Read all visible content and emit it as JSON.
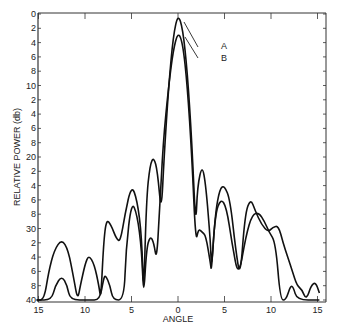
{
  "chart_data": {
    "type": "line",
    "title": "",
    "xlabel": "ANGLE",
    "ylabel": "RELATIVE POWER (db)",
    "xlim": [
      -15,
      15
    ],
    "ylim": [
      0,
      40
    ],
    "y_inverted": true,
    "grid": false,
    "x_ticks": [
      -15,
      -10,
      -5,
      0,
      5,
      10,
      15
    ],
    "x_tick_labels": [
      "15",
      "10",
      "5",
      "0",
      "5",
      "10",
      "15"
    ],
    "y_ticks": [
      0,
      2,
      4,
      6,
      8,
      10,
      12,
      14,
      16,
      18,
      20,
      22,
      24,
      26,
      28,
      30,
      32,
      34,
      36,
      38,
      40
    ],
    "y_tick_labels": [
      "0",
      "2",
      "4",
      "6",
      "8",
      "10",
      "2",
      "4",
      "6",
      "8",
      "20",
      "2",
      "4",
      "6",
      "8",
      "30",
      "2",
      "4",
      "6",
      "8",
      "40"
    ],
    "annotations": [
      {
        "text": "A",
        "points_to": "curve A peak"
      },
      {
        "text": "B",
        "points_to": "curve B peak"
      }
    ],
    "series": [
      {
        "name": "A",
        "points": [
          [
            -15.2,
            40
          ],
          [
            -14.4,
            40
          ],
          [
            -13.9,
            36
          ],
          [
            -13.3,
            33
          ],
          [
            -12.5,
            31.5
          ],
          [
            -11.8,
            33
          ],
          [
            -11.2,
            37
          ],
          [
            -10.8,
            40
          ],
          [
            -10.5,
            38
          ],
          [
            -10.0,
            35
          ],
          [
            -9.6,
            33.7
          ],
          [
            -9.0,
            35
          ],
          [
            -8.5,
            38
          ],
          [
            -8.3,
            40
          ],
          [
            -8.0,
            32
          ],
          [
            -7.7,
            28.7
          ],
          [
            -7.2,
            29.5
          ],
          [
            -6.6,
            31.5
          ],
          [
            -6.2,
            31.8
          ],
          [
            -5.7,
            28
          ],
          [
            -5.0,
            23.9
          ],
          [
            -4.4,
            26
          ],
          [
            -3.9,
            31
          ],
          [
            -3.7,
            40
          ],
          [
            -3.4,
            26
          ],
          [
            -3.0,
            21
          ],
          [
            -2.6,
            20.0
          ],
          [
            -2.2,
            22
          ],
          [
            -1.8,
            28
          ],
          [
            -1.5,
            20
          ],
          [
            -1.0,
            10
          ],
          [
            -0.5,
            3
          ],
          [
            0,
            0
          ],
          [
            0.5,
            2
          ],
          [
            1.0,
            8
          ],
          [
            1.5,
            18
          ],
          [
            1.9,
            30
          ],
          [
            2.1,
            24
          ],
          [
            2.6,
            21.1
          ],
          [
            3.0,
            24
          ],
          [
            3.5,
            32
          ],
          [
            3.6,
            36
          ],
          [
            4.0,
            28
          ],
          [
            4.5,
            24.4
          ],
          [
            5.0,
            24
          ],
          [
            5.6,
            26
          ],
          [
            6.2,
            33
          ],
          [
            6.7,
            37
          ],
          [
            7.2,
            28
          ],
          [
            7.8,
            25.8
          ],
          [
            8.3,
            27.5
          ],
          [
            9.0,
            29.5
          ],
          [
            9.7,
            30.5
          ],
          [
            10.2,
            29.8
          ],
          [
            10.8,
            29.6
          ],
          [
            11.3,
            32
          ],
          [
            11.8,
            34
          ],
          [
            12.3,
            36
          ],
          [
            12.8,
            38
          ],
          [
            13.3,
            38.5
          ],
          [
            13.8,
            40
          ],
          [
            14.3,
            38
          ],
          [
            14.8,
            37.5
          ],
          [
            15.2,
            39
          ]
        ]
      },
      {
        "name": "B",
        "points": [
          [
            -15.2,
            40
          ],
          [
            -13.6,
            40
          ],
          [
            -13.2,
            38
          ],
          [
            -12.5,
            36.6
          ],
          [
            -11.9,
            38
          ],
          [
            -11.6,
            40
          ],
          [
            -9.6,
            40
          ],
          [
            -8.4,
            40
          ],
          [
            -8.0,
            37
          ],
          [
            -7.8,
            36.5
          ],
          [
            -7.3,
            38
          ],
          [
            -7.0,
            40
          ],
          [
            -5.8,
            40
          ],
          [
            -5.6,
            33
          ],
          [
            -5.0,
            26.2
          ],
          [
            -4.4,
            28
          ],
          [
            -3.9,
            33
          ],
          [
            -3.7,
            40
          ],
          [
            -3.4,
            33
          ],
          [
            -3.0,
            31
          ],
          [
            -2.6,
            32
          ],
          [
            -2.3,
            34.5
          ],
          [
            -2.0,
            28
          ],
          [
            -1.6,
            18
          ],
          [
            -1.0,
            10
          ],
          [
            -0.5,
            5
          ],
          [
            0,
            2.5
          ],
          [
            0.5,
            4
          ],
          [
            1.0,
            10
          ],
          [
            1.5,
            20
          ],
          [
            1.9,
            32
          ],
          [
            2.2,
            30
          ],
          [
            2.6,
            30.5
          ],
          [
            3.0,
            31
          ],
          [
            3.5,
            35
          ],
          [
            3.6,
            36
          ],
          [
            4.0,
            28
          ],
          [
            4.6,
            25.8
          ],
          [
            5.2,
            27
          ],
          [
            5.8,
            32
          ],
          [
            6.5,
            37
          ],
          [
            7.3,
            31
          ],
          [
            8.0,
            28
          ],
          [
            8.7,
            27.8
          ],
          [
            9.3,
            29
          ],
          [
            9.8,
            30.5
          ],
          [
            10.5,
            32
          ],
          [
            11.0,
            40
          ],
          [
            11.6,
            40
          ],
          [
            12.1,
            38
          ],
          [
            12.4,
            38.2
          ],
          [
            12.8,
            40
          ],
          [
            15.2,
            40
          ]
        ]
      }
    ]
  },
  "labels": {
    "x_axis_title": "ANGLE",
    "y_axis_title": "RELATIVE POWER (db)",
    "annotation_a": "A",
    "annotation_b": "B"
  }
}
